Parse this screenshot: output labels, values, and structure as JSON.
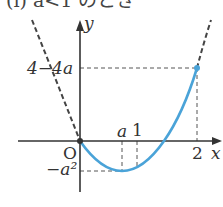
{
  "title": "(i)  a<1 のとき",
  "axes": {
    "x_label": "x",
    "y_label": "y",
    "origin_label": "O"
  },
  "labels": {
    "y_max": "4−4a",
    "y_min": "−a²",
    "x_a": "a",
    "x_1": "1",
    "x_2": "2"
  },
  "colors": {
    "curve": "#4aa3d8",
    "axis": "#333333",
    "dashed": "#444444"
  },
  "curve": {
    "description": "y = x² − 2ax, drawn for 0 ≤ x ≤ 2; dashed extension outside",
    "vertex": "(a, −a²)",
    "endpoint": "(2, 4−4a)"
  }
}
